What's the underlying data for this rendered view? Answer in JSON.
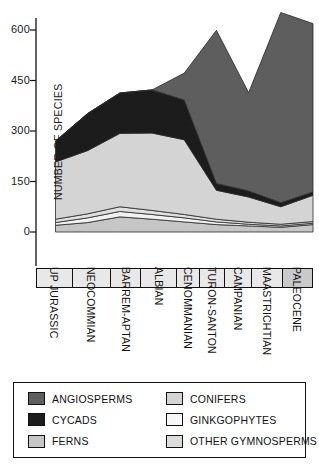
{
  "chart_data": {
    "type": "area",
    "stacked": true,
    "title": "",
    "xlabel": "",
    "ylabel": "NUMBER OF SPECIES",
    "categories": [
      "UP JURASSIC",
      "NEOCOMMIAN",
      "BARREM-APTAN",
      "ALBIAN",
      "CENOMMANIAN",
      "TURON-SANTON",
      "CAMPANIAN",
      "MAASTRICHTIAN",
      "PALEOCENE"
    ],
    "yticks": [
      0,
      150,
      300,
      450,
      600
    ],
    "ylim": [
      0,
      640
    ],
    "grid": false,
    "legend_position": "bottom",
    "stack_order_bottom_to_top": [
      "FERNS",
      "GINKGOPHYTES",
      "OTHER GYMNOSPERMS",
      "CONIFERS",
      "CYCADS",
      "ANGIOSPERMS"
    ],
    "series": [
      {
        "name": "FERNS",
        "color": "#c6c6c6",
        "values": [
          20,
          28,
          45,
          38,
          30,
          22,
          18,
          14,
          22
        ]
      },
      {
        "name": "GINKGOPHYTES",
        "color": "#f2f2f2",
        "values": [
          8,
          14,
          16,
          14,
          12,
          8,
          5,
          4,
          4
        ]
      },
      {
        "name": "OTHER GYMNOSPERMS",
        "color": "#e0e0e0",
        "values": [
          10,
          12,
          14,
          12,
          10,
          8,
          6,
          5,
          5
        ]
      },
      {
        "name": "CONIFERS",
        "color": "#d4d4d4",
        "values": [
          170,
          188,
          218,
          230,
          222,
          86,
          75,
          52,
          78
        ]
      },
      {
        "name": "CYCADS",
        "color": "#1c1c1c",
        "values": [
          62,
          110,
          120,
          128,
          118,
          20,
          18,
          12,
          10
        ]
      },
      {
        "name": "ANGIOSPERMS",
        "color": "#5e5e5e",
        "values": [
          0,
          0,
          0,
          0,
          80,
          455,
          292,
          565,
          500
        ]
      }
    ]
  },
  "legend": {
    "items": [
      {
        "label": "ANGIOSPERMS",
        "color": "#5e5e5e"
      },
      {
        "label": "CONIFERS",
        "color": "#d4d4d4"
      },
      {
        "label": "CYCADS",
        "color": "#1c1c1c"
      },
      {
        "label": "GINKGOPHYTES",
        "color": "#f7f7f7"
      },
      {
        "label": "FERNS",
        "color": "#c6c6c6"
      },
      {
        "label": "OTHER GYMNOSPERMS",
        "color": "#dcdcdc"
      }
    ]
  }
}
